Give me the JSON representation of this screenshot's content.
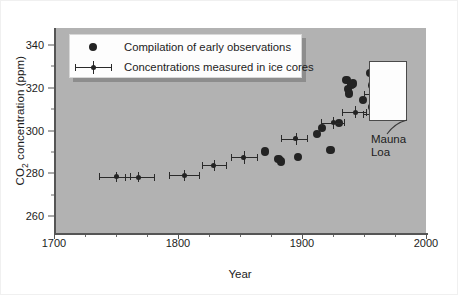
{
  "chart_data": {
    "type": "scatter",
    "title": "",
    "xlabel": "Year",
    "ylabel_prefix": "CO",
    "ylabel_sub": "2",
    "ylabel_suffix": " concentration (ppm)",
    "ylabel_plain": "CO2 concentration (ppm)",
    "xlim": [
      1700,
      2000
    ],
    "ylim": [
      252,
      348
    ],
    "grid": false,
    "xticks": [
      1700,
      1800,
      1900,
      2000
    ],
    "xtick_labels": [
      "1700",
      "1800",
      "1900",
      "2000"
    ],
    "xminor_step": 25,
    "yticks": [
      260,
      280,
      300,
      320,
      340
    ],
    "ytick_labels": [
      "260",
      "280",
      "300",
      "320",
      "340"
    ],
    "yminor": [
      250,
      270,
      290,
      310,
      330
    ],
    "legend_position": "upper-left",
    "series": [
      {
        "name": "Compilation of early observations",
        "marker": "filled-circle",
        "color": "#232323",
        "points": [
          {
            "x": 1870,
            "y": 290.2
          },
          {
            "x": 1881,
            "y": 286.6
          },
          {
            "x": 1883,
            "y": 285.4
          },
          {
            "x": 1897,
            "y": 287.6
          },
          {
            "x": 1912,
            "y": 298.3
          },
          {
            "x": 1916,
            "y": 301.3
          },
          {
            "x": 1923,
            "y": 291.0
          },
          {
            "x": 1930,
            "y": 303.4
          },
          {
            "x": 1936,
            "y": 323.6
          },
          {
            "x": 1937,
            "y": 319.4
          },
          {
            "x": 1938,
            "y": 317.4
          },
          {
            "x": 1940,
            "y": 321.6
          },
          {
            "x": 1941,
            "y": 322.0
          },
          {
            "x": 1949,
            "y": 314.4
          },
          {
            "x": 1955,
            "y": 326.8
          },
          {
            "x": 1957,
            "y": 321.0
          },
          {
            "x": 1957,
            "y": 311.0
          }
        ]
      },
      {
        "name": "Concentrations measured in ice cores",
        "marker": "point-with-error-bars",
        "color": "#2a2a2a",
        "points": [
          {
            "x": 1750,
            "y": 278.4,
            "xerr_low": 14,
            "xerr_high": 11,
            "yerr": 2.4
          },
          {
            "x": 1768,
            "y": 278.2,
            "xerr_low": 11,
            "xerr_high": 13,
            "yerr": 2.4
          },
          {
            "x": 1805,
            "y": 279.0,
            "xerr_low": 12,
            "xerr_high": 12,
            "yerr": 2.6
          },
          {
            "x": 1829,
            "y": 283.8,
            "xerr_low": 10,
            "xerr_high": 10,
            "yerr": 2.6
          },
          {
            "x": 1853,
            "y": 287.4,
            "xerr_low": 10,
            "xerr_high": 11,
            "yerr": 3.0
          },
          {
            "x": 1895,
            "y": 296.2,
            "xerr_low": 12,
            "xerr_high": 9,
            "yerr": 2.8
          },
          {
            "x": 1925,
            "y": 303.6,
            "xerr_low": 10,
            "xerr_high": 9,
            "yerr": 2.8
          },
          {
            "x": 1943,
            "y": 308.6,
            "xerr_low": 11,
            "xerr_high": 9,
            "yerr": 2.8
          },
          {
            "x": 1958,
            "y": 307.6,
            "xerr_low": 9,
            "xerr_high": 8,
            "yerr": 2.6
          },
          {
            "x": 1962,
            "y": 317.0,
            "xerr_low": 12,
            "xerr_high": 11,
            "yerr": 3.0
          },
          {
            "x": 1972,
            "y": 326.2,
            "xerr_low": 6,
            "xerr_high": 5,
            "yerr": 3.0
          }
        ]
      }
    ],
    "annotations": [
      {
        "name": "mauna-loa",
        "text": "Mauna\nLoa",
        "box": {
          "x0": 1954,
          "x1": 1985,
          "y0": 304.5,
          "y1": 332.5
        }
      }
    ]
  },
  "legend": {
    "entries": [
      {
        "label": "Compilation of early observations",
        "key": "filled-circle"
      },
      {
        "label": "Concentrations measured in ice cores",
        "key": "point-with-error-bars"
      }
    ]
  },
  "colors": {
    "plot_background": "#b2b2b2",
    "axis": "#555555",
    "data": "#232323",
    "legend_background": "#fdfdfd",
    "inset_background": "#fdfdfd",
    "figure_background": "#ffffff"
  }
}
